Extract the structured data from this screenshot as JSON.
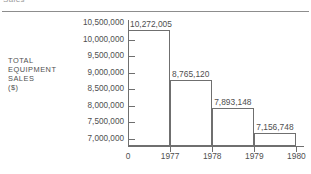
{
  "heading": {
    "clipped_text": "Sales"
  },
  "chart_data": {
    "type": "bar",
    "title": "",
    "xlabel": "",
    "ylabel": "TOTAL EQUIPMENT SALES ($)",
    "ylabel_lines": [
      "TOTAL",
      "EQUIPMENT",
      "SALES",
      "($)"
    ],
    "categories": [
      "1977",
      "1978",
      "1979",
      "1980"
    ],
    "values": [
      10272005,
      8765120,
      7893148,
      7156748
    ],
    "data_labels": [
      "10,272,005",
      "8,765,120",
      "7,893,148",
      "7,156,748"
    ],
    "ylim": [
      6750000,
      10600000
    ],
    "ytick_values": [
      10500000,
      10000000,
      9500000,
      9000000,
      8500000,
      8000000,
      7500000,
      7000000
    ],
    "ytick_labels": [
      "10,500,000",
      "10,000,000",
      "9,500,000",
      "9,000,000",
      "8,500,000",
      "8,000,000",
      "7,500,000",
      "7,000,000"
    ],
    "xtick_labels": [
      "0",
      "1977",
      "1978",
      "1979",
      "1980"
    ],
    "grid": false,
    "legend": "none",
    "bar_style": "outline",
    "colors": {
      "axis": "#6f6f6f",
      "bar_outline": "#6f6f6f",
      "text": "#4f4f4f",
      "rule": "#8d8d8d",
      "background": "#ffffff"
    }
  }
}
